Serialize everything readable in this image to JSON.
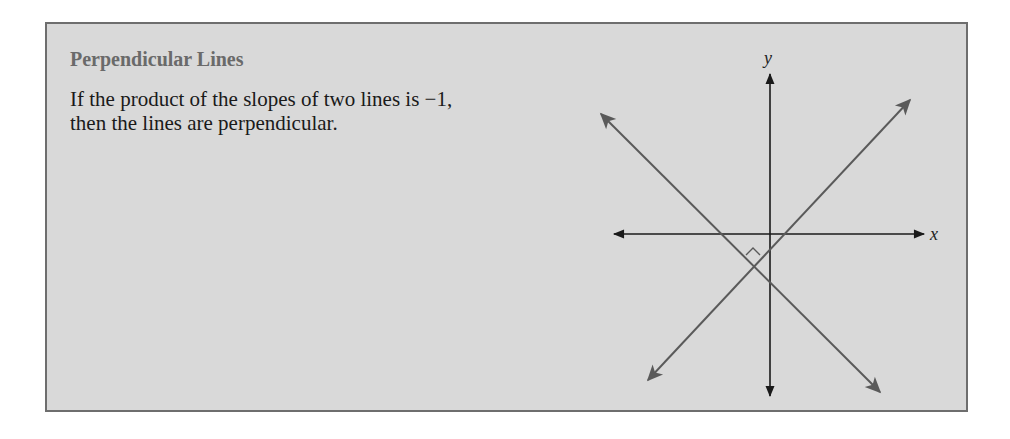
{
  "box": {
    "title": "Perpendicular Lines",
    "text": "If the product of the slopes of two lines is −1, then the lines are perpendicular.",
    "background": "#d9d9d9",
    "border": "#6e6e6e"
  },
  "diagram": {
    "x_axis_label": "x",
    "y_axis_label": "y",
    "axis_color": "#1a1a1a",
    "line_color": "#5a5a5a",
    "lines": [
      {
        "name": "negative-slope-line",
        "from": [
          600,
          113
        ],
        "to": [
          880,
          392
        ]
      },
      {
        "name": "positive-slope-line",
        "from": [
          648,
          380
        ],
        "to": [
          910,
          100
        ]
      }
    ],
    "right_angle_marker": true
  }
}
